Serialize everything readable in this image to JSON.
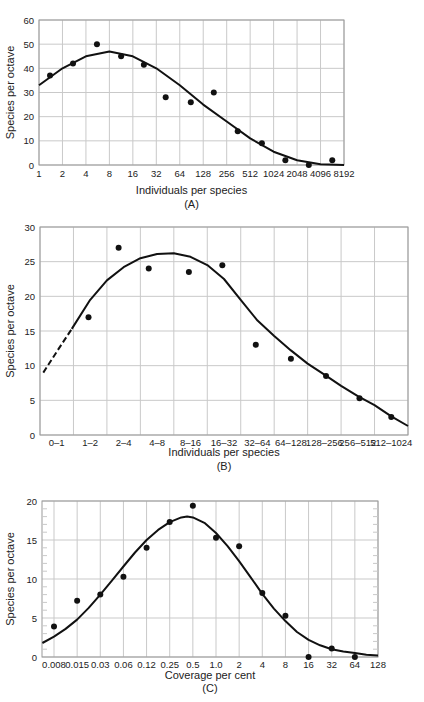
{
  "chart_data": [
    {
      "id": "A",
      "type": "scatter",
      "caption": "(A)",
      "xlabel": "Individuals per species",
      "ylabel": "Species per octave",
      "x_tick_labels": [
        "1",
        "2",
        "4",
        "8",
        "16",
        "32",
        "64",
        "128",
        "256",
        "512",
        "1024",
        "2048",
        "4096",
        "8192"
      ],
      "y_ticks": [
        0,
        10,
        20,
        30,
        40,
        50,
        60
      ],
      "ylim": [
        0,
        60
      ],
      "grid": true,
      "points": {
        "x_octave": [
          0.47,
          1.45,
          2.47,
          3.5,
          4.47,
          5.4,
          6.47,
          7.45,
          8.47,
          9.5,
          10.5,
          11.5,
          12.5
        ],
        "y": [
          37,
          42,
          50,
          45,
          41.5,
          28,
          26,
          30,
          14,
          9,
          2,
          0,
          2
        ]
      },
      "fitted_curve": {
        "x_octave": [
          0,
          1,
          2,
          3,
          4,
          5,
          6,
          7,
          8,
          9,
          10,
          11,
          12,
          13
        ],
        "y": [
          33,
          40,
          45,
          47,
          45,
          40,
          33,
          25,
          18,
          11,
          5.5,
          2,
          0.3,
          0
        ]
      }
    },
    {
      "id": "B",
      "type": "scatter",
      "caption": "(B)",
      "xlabel": "Individuals per species",
      "ylabel": "Species per octave",
      "categories": [
        "0–1",
        "1–2",
        "2–4",
        "4–8",
        "8–16",
        "16–32",
        "32–64",
        "64–128",
        "128–256",
        "256–512",
        "512–1024"
      ],
      "y_ticks": [
        0,
        5,
        10,
        15,
        20,
        25,
        30
      ],
      "ylim": [
        0,
        30
      ],
      "grid": true,
      "points": {
        "x_band": [
          1.45,
          2.35,
          3.25,
          4.45,
          5.45,
          6.45,
          7.5,
          8.55,
          9.55,
          10.5
        ],
        "y": [
          17,
          27,
          24,
          23.5,
          24.5,
          13,
          11,
          8.5,
          5.3,
          2.6
        ]
      },
      "fitted_curve": {
        "dashed_segment": {
          "x_band": [
            0.1,
            0.5,
            0.95
          ],
          "y": [
            9,
            12,
            15.3
          ]
        },
        "x_band": [
          0.95,
          1.5,
          2,
          2.5,
          3,
          3.5,
          4,
          4.5,
          5,
          5.5,
          6,
          6.5,
          7,
          7.5,
          8,
          8.5,
          9,
          9.5,
          10,
          10.5,
          11
        ],
        "y": [
          15.3,
          19.5,
          22.3,
          24.2,
          25.5,
          26.1,
          26.2,
          25.7,
          24.5,
          22.5,
          19.5,
          16.5,
          14.3,
          12.2,
          10.3,
          8.7,
          7.1,
          5.6,
          4.3,
          2.7,
          1.3
        ]
      }
    },
    {
      "id": "C",
      "type": "scatter",
      "caption": "(C)",
      "xlabel": "Coverage per cent",
      "ylabel": "Species per octave",
      "x_tick_labels": [
        "0.008",
        "0.015",
        "0.03",
        "0.06",
        "0.12",
        "0.25",
        "0.5",
        "1.0",
        "2",
        "4",
        "8",
        "16",
        "32",
        "64",
        "128"
      ],
      "y_ticks": [
        0,
        5,
        10,
        15,
        20
      ],
      "ylim": [
        0,
        20
      ],
      "grid": true,
      "minor_y_ticks": true,
      "points": {
        "x_index": [
          0,
          1,
          2,
          3,
          4,
          5,
          6,
          7,
          8,
          9,
          10,
          11,
          12,
          13
        ],
        "y": [
          3.9,
          7.2,
          8,
          10.3,
          14,
          17.3,
          19.4,
          15.3,
          14.2,
          8.2,
          5.3,
          0,
          1.1,
          0
        ]
      },
      "fitted_curve": {
        "x_index": [
          -0.5,
          0,
          0.5,
          1,
          1.5,
          2,
          2.5,
          3,
          3.5,
          4,
          4.5,
          5,
          5.5,
          5.75,
          6,
          6.5,
          7,
          7.5,
          8,
          8.5,
          9,
          9.5,
          10,
          10.5,
          11,
          11.5,
          12,
          12.5,
          13,
          13.5,
          14
        ],
        "y": [
          1.8,
          2.6,
          3.6,
          4.8,
          6.3,
          8,
          9.8,
          11.6,
          13.4,
          15,
          16.3,
          17.3,
          17.9,
          18,
          17.9,
          17.2,
          15.9,
          14.2,
          12.3,
          10.2,
          8.1,
          6.2,
          4.6,
          3.2,
          2.2,
          1.5,
          1,
          0.7,
          0.5,
          0.3,
          0.2
        ]
      }
    }
  ]
}
